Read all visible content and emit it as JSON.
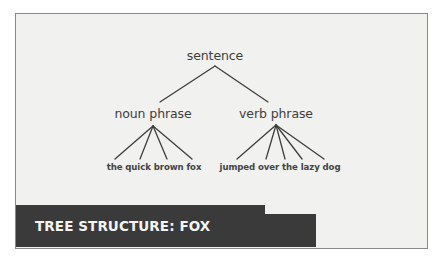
{
  "diagram": {
    "type": "syntax-tree",
    "root": {
      "label": "sentence",
      "x": 215,
      "y": 48
    },
    "phrases": [
      {
        "label": "noun phrase",
        "x": 153,
        "y": 106
      },
      {
        "label": "verb phrase",
        "x": 276,
        "y": 106
      }
    ],
    "leaves": [
      {
        "label": "the quick brown fox",
        "x": 154,
        "y": 162
      },
      {
        "label": "jumped over the lazy dog",
        "x": 280,
        "y": 162
      }
    ],
    "edges": [
      {
        "from": [
          215,
          66
        ],
        "to": [
          160,
          102
        ]
      },
      {
        "from": [
          215,
          66
        ],
        "to": [
          268,
          102
        ]
      },
      {
        "from": [
          153,
          126
        ],
        "to": [
          115,
          159
        ]
      },
      {
        "from": [
          153,
          126
        ],
        "to": [
          140,
          159
        ]
      },
      {
        "from": [
          153,
          126
        ],
        "to": [
          167,
          159
        ]
      },
      {
        "from": [
          153,
          126
        ],
        "to": [
          192,
          159
        ]
      },
      {
        "from": [
          276,
          125
        ],
        "to": [
          237,
          159
        ]
      },
      {
        "from": [
          276,
          125
        ],
        "to": [
          266,
          159
        ]
      },
      {
        "from": [
          276,
          125
        ],
        "to": [
          285,
          159
        ]
      },
      {
        "from": [
          276,
          125
        ],
        "to": [
          302,
          159
        ]
      },
      {
        "from": [
          276,
          125
        ],
        "to": [
          324,
          159
        ]
      }
    ],
    "colors": {
      "background": "#f1f1ef",
      "border": "#8a8a8a",
      "line": "#3e3e3e",
      "text": "#3e3e3e",
      "banner": "#3a3a3a",
      "banner_text": "#f4f4f4"
    }
  },
  "banner": {
    "title": "TREE STRUCTURE: FOX"
  }
}
